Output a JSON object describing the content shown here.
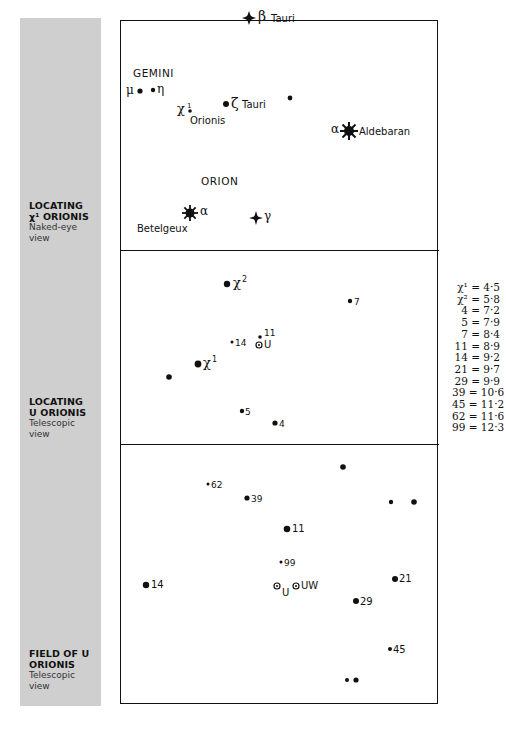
{
  "sidebar": {
    "color": "#cfcfcf",
    "captions": [
      {
        "title_1": "LOCATING",
        "title_2": "χ¹ ORIONIS",
        "sub_1": "Naked-eye",
        "sub_2": "view"
      },
      {
        "title_1": "LOCATING",
        "title_2": "U ORIONIS",
        "sub_1": "Telescopic",
        "sub_2": "view"
      },
      {
        "title_1": "FIELD OF U",
        "title_2": "ORIONIS",
        "sub_1": "Telescopic",
        "sub_2": "view"
      }
    ]
  },
  "panel1": {
    "constellations": {
      "gemini": "GEMINI",
      "orion": "ORION"
    },
    "labels": {
      "beta_tauri_greek": "β",
      "beta_tauri_name": "Tauri",
      "mu": "μ",
      "eta": "η",
      "chi1": "χ",
      "chi1_sup": "1",
      "chi1_name": "Orionis",
      "zeta_greek": "ζ",
      "zeta_name": "Tauri",
      "alpha_tau_greek": "α",
      "alpha_tau_name": "Aldebaran",
      "alpha_ori_greek": "α",
      "alpha_ori_name": "Betelgeux",
      "gamma_ori_greek": "γ"
    }
  },
  "panel2": {
    "labels": {
      "chi2": "χ",
      "chi2_sup": "2",
      "chi1": "χ",
      "chi1_sup": "1",
      "s7": "7",
      "s11": "11",
      "s14": "14",
      "u": "U",
      "s5": "5",
      "s4": "4"
    }
  },
  "panel3": {
    "labels": {
      "s62": "62",
      "s39": "39",
      "s11": "11",
      "s99": "99",
      "s14": "14",
      "u": "U",
      "uw": "UW",
      "s21": "21",
      "s29": "29",
      "s45": "45"
    }
  },
  "magnitude_key": [
    {
      "star": "χ¹",
      "mag": "4·5"
    },
    {
      "star": "χ²",
      "mag": "5·8"
    },
    {
      "star": "4",
      "mag": "7·2"
    },
    {
      "star": "5",
      "mag": "7·9"
    },
    {
      "star": "7",
      "mag": "8·4"
    },
    {
      "star": "11",
      "mag": "8·9"
    },
    {
      "star": "14",
      "mag": "9·2"
    },
    {
      "star": "21",
      "mag": "9·7"
    },
    {
      "star": "29",
      "mag": "9·9"
    },
    {
      "star": "39",
      "mag": "10·6"
    },
    {
      "star": "45",
      "mag": "11·2"
    },
    {
      "star": "62",
      "mag": "11·6"
    },
    {
      "star": "99",
      "mag": "12·3"
    }
  ],
  "key_lines": [
    "χ¹ = 4·5",
    "χ² = 5·8",
    "4 = 7·2",
    "5 = 7·9",
    "7 = 8·4",
    "11 = 8·9",
    "14 = 9·2",
    "21 = 9·7",
    "29 = 9·9",
    "39 = 10·6",
    "45 = 11·2",
    "62 = 11·6",
    "99 = 12·3"
  ]
}
